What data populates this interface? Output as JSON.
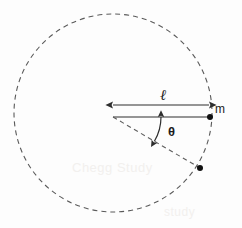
{
  "figure": {
    "background_color": "#fdfdfd",
    "stroke_color": "#3a3a3a",
    "dash_color": "#5a5a5a"
  },
  "labels": {
    "length": "ℓ",
    "mass": "m",
    "angle": "θ"
  },
  "watermarks": {
    "primary": "Chegg Study",
    "secondary": "study"
  },
  "chart_data": {
    "type": "diagram",
    "units": "pixels",
    "canvas": {
      "width": 242,
      "height": 228
    },
    "elements": [
      {
        "id": "orbit-circle",
        "kind": "circle",
        "style": "dashed",
        "center": {
          "x": 113,
          "y": 113
        },
        "radius": 99,
        "stroke": "#5a5a5a",
        "dash_pattern": "5 4",
        "fill": "none"
      },
      {
        "id": "length-dimension-arrow",
        "kind": "double-headed-arrow",
        "style": "solid",
        "from": {
          "x": 113,
          "y": 105
        },
        "to": {
          "x": 209,
          "y": 105
        },
        "label": "ℓ",
        "label_position": {
          "x": 166,
          "y": 96
        }
      },
      {
        "id": "radius-line",
        "kind": "line",
        "style": "solid",
        "from": {
          "x": 113,
          "y": 117
        },
        "to": {
          "x": 210,
          "y": 117
        }
      },
      {
        "id": "mass-point",
        "kind": "point",
        "at": {
          "x": 210,
          "y": 117
        },
        "radius": 3,
        "fill": "#111111",
        "label": "m",
        "label_position": {
          "x": 218,
          "y": 109
        }
      },
      {
        "id": "displaced-radius-line",
        "kind": "line",
        "style": "dashed",
        "from": {
          "x": 113,
          "y": 117
        },
        "to": {
          "x": 200,
          "y": 168
        }
      },
      {
        "id": "displaced-mass-point",
        "kind": "point",
        "at": {
          "x": 200,
          "y": 168
        },
        "radius": 3,
        "fill": "#111111"
      },
      {
        "id": "angle-arc-arrow",
        "kind": "curved-double-headed-arrow",
        "style": "solid",
        "arc_center": {
          "x": 113,
          "y": 117
        },
        "arc_radius": 48,
        "start_angle_deg": 0,
        "end_angle_deg": 30.4,
        "label": "θ",
        "label_position": {
          "x": 173,
          "y": 132
        }
      }
    ],
    "measurements": {
      "angle_theta_deg": 30,
      "radius_length_l": 97
    }
  }
}
